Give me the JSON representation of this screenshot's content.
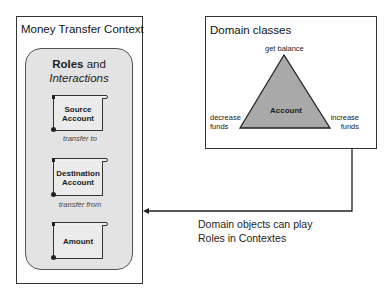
{
  "money_transfer_context": {
    "title": "Money Transfer Context",
    "roles_panel": {
      "heading_bold": "Roles",
      "heading_and": " and",
      "heading_italic": "Interactions",
      "roles": [
        {
          "line1": "Source",
          "line2": "Account",
          "icon": "scroll-icon"
        },
        {
          "line1": "Destination",
          "line2": "Account",
          "icon": "scroll-icon"
        },
        {
          "line1": "Amount",
          "line2": "",
          "icon": "scroll-icon"
        }
      ],
      "interactions": [
        "transfer to",
        "transfer from"
      ]
    }
  },
  "domain_classes": {
    "title": "Domain classes",
    "class_name": "Account",
    "operations": {
      "top": "get balance",
      "left_line1": "decrease",
      "left_line2": "funds",
      "right_line1": "increase",
      "right_line2": "funds"
    },
    "colors": {
      "triangle_fill": "#a9a9a9",
      "triangle_stroke": "#222222"
    }
  },
  "connector": {
    "note_line1": "Domain objects can play",
    "note_line2": "Roles in Contextes",
    "direction": "domain-classes-to-money-transfer-context"
  }
}
